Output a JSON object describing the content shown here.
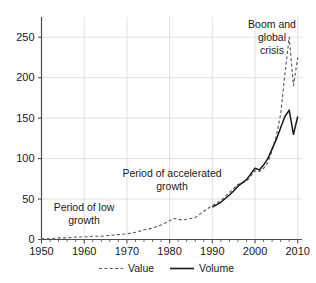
{
  "chart_data": {
    "type": "line",
    "title": "",
    "subtitle": "",
    "xlabel": "",
    "ylabel": "",
    "xlim": [
      1950,
      2011
    ],
    "ylim": [
      0,
      275
    ],
    "grid": true,
    "legend_position": "bottom",
    "x_ticks": [
      "1950",
      "1960",
      "1970",
      "1980",
      "1990",
      "2000",
      "2010"
    ],
    "x_tick_values": [
      1950,
      1960,
      1970,
      1980,
      1990,
      2000,
      2010
    ],
    "x_minor_tick_step": 2,
    "y_ticks": [
      "0",
      "50",
      "100",
      "150",
      "200",
      "250"
    ],
    "y_tick_values": [
      0,
      50,
      100,
      150,
      200,
      250
    ],
    "series": [
      {
        "name": "Value",
        "style": "dashed",
        "color": "#555555",
        "x": [
          1950,
          1952,
          1954,
          1956,
          1958,
          1960,
          1962,
          1964,
          1966,
          1968,
          1970,
          1972,
          1974,
          1976,
          1978,
          1980,
          1981,
          1982,
          1983,
          1984,
          1985,
          1986,
          1987,
          1988,
          1990,
          1992,
          1994,
          1995,
          1996,
          1998,
          2000,
          2001,
          2002,
          2003,
          2004,
          2005,
          2006,
          2007,
          2008,
          2009,
          2010
        ],
        "values": [
          1,
          1,
          2,
          2,
          3,
          3,
          4,
          4,
          5,
          6,
          7,
          9,
          12,
          14,
          18,
          23,
          26,
          25,
          24,
          25,
          26,
          27,
          31,
          35,
          42,
          48,
          58,
          63,
          68,
          72,
          85,
          84,
          88,
          95,
          110,
          128,
          155,
          205,
          250,
          190,
          225
        ],
        "ylim": [
          0,
          275
        ]
      },
      {
        "name": "Volume",
        "style": "solid",
        "color": "#1a1a1a",
        "x": [
          1990,
          1992,
          1994,
          1995,
          1996,
          1998,
          2000,
          2001,
          2002,
          2003,
          2004,
          2005,
          2006,
          2007,
          2008,
          2009,
          2010
        ],
        "values": [
          40,
          46,
          55,
          60,
          66,
          74,
          88,
          86,
          92,
          100,
          112,
          124,
          138,
          152,
          160,
          130,
          152
        ],
        "ylim": [
          0,
          275
        ]
      }
    ],
    "annotations": [
      {
        "id": "low-growth",
        "text": "Period of low\ngrowth",
        "lines": [
          "Period of low",
          "growth"
        ]
      },
      {
        "id": "accelerated-growth",
        "text": "Period of accelerated\ngrowth",
        "lines": [
          "Period of accelerated",
          "growth"
        ]
      },
      {
        "id": "boom-crisis",
        "text": "Boom and\nglobal\ncrisis",
        "lines": [
          "Boom and",
          "global",
          "crisis"
        ]
      }
    ]
  },
  "legend": {
    "items": [
      {
        "label": "Value",
        "style": "dashed"
      },
      {
        "label": "Volume",
        "style": "solid"
      }
    ]
  },
  "colors": {
    "axis": "#4d4d4d",
    "grid": "#d9d9d9",
    "value_series": "#555555",
    "volume_series": "#1a1a1a",
    "text": "#1a1a1a",
    "background": "#ffffff"
  }
}
